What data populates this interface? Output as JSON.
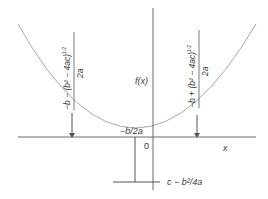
{
  "diagram": {
    "y_axis_label": "f(x)",
    "x_axis_label": "x",
    "origin_label": "0",
    "vertex_x_label": "−b/2a",
    "vertex_y_label": "c − b²/4a",
    "left_root": {
      "numerator": "−b − (b² − 4ac)",
      "exponent": "1/2",
      "denominator": "2a"
    },
    "right_root": {
      "numerator": "−b + (b² − 4ac)",
      "exponent": "1/2",
      "denominator": "2a"
    },
    "colors": {
      "axis": "#6a6a6a",
      "curve": "#a8a8a8",
      "text": "#3a3a3a"
    }
  }
}
